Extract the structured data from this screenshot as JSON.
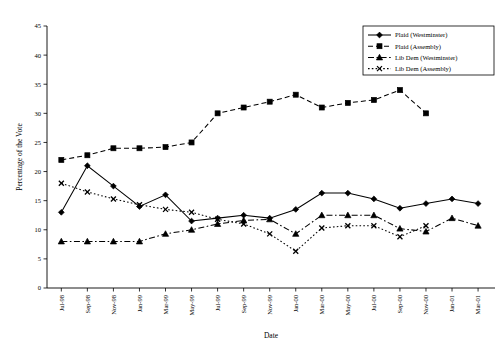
{
  "chart_data": {
    "type": "line",
    "title": "",
    "xlabel": "Date",
    "ylabel": "Percentage of the Vote",
    "ylim": [
      0,
      45
    ],
    "ytick_step": 5,
    "yticks": [
      0,
      5,
      10,
      15,
      20,
      25,
      30,
      35,
      40,
      45
    ],
    "grid": false,
    "legend_position": "top-right",
    "categories": [
      "Jul-98",
      "Sep-98",
      "Nov-98",
      "Jan-99",
      "Mar-99",
      "May-99",
      "Jul-99",
      "Sep-99",
      "Nov-99",
      "Jan-00",
      "Mar-00",
      "May-00",
      "Jul-00",
      "Sep-00",
      "Nov-00",
      "Jan-01",
      "Mar-01"
    ],
    "series": [
      {
        "name": "Plaid (Westminster)",
        "marker": "diamond",
        "dash": "solid",
        "color": "#000000",
        "values": [
          13,
          21,
          17.5,
          14,
          16,
          11.5,
          12,
          12.5,
          12,
          13.5,
          16.3,
          16.3,
          15.3,
          13.7,
          14.5,
          15.3,
          14.5
        ]
      },
      {
        "name": "Plaid (Assembly)",
        "marker": "square",
        "dash": "dashed",
        "color": "#000000",
        "values": [
          22,
          22.8,
          24,
          24,
          24.2,
          25,
          30,
          31,
          32,
          33.2,
          31,
          31.8,
          32.3,
          34,
          30,
          null,
          null
        ]
      },
      {
        "name": "Lib Dem (Westminster)",
        "marker": "triangle",
        "dash": "dash-dot",
        "color": "#000000",
        "values": [
          8,
          8,
          8,
          8,
          9.3,
          10,
          11,
          11.6,
          11.8,
          9.3,
          12.5,
          12.5,
          12.5,
          10.2,
          9.7,
          12,
          10.7
        ]
      },
      {
        "name": "Lib Dem (Assembly)",
        "marker": "cross",
        "dash": "dotted",
        "color": "#000000",
        "values": [
          18,
          16.5,
          15.3,
          14.3,
          13.5,
          13,
          11.8,
          11,
          9.3,
          6.3,
          10.3,
          10.7,
          10.7,
          8.8,
          10.7,
          null,
          null
        ]
      }
    ]
  },
  "legend": {
    "items": [
      {
        "label": "Plaid (Westminster)"
      },
      {
        "label": "Plaid (Assembly)"
      },
      {
        "label": "Lib Dem (Westminster)"
      },
      {
        "label": "Lib Dem (Assembly)"
      }
    ]
  }
}
